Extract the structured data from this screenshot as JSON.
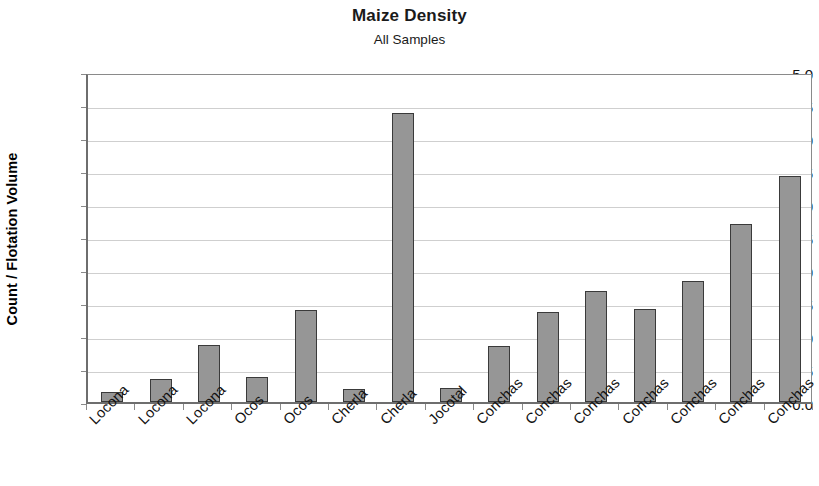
{
  "chart_data": {
    "type": "bar",
    "title": "Maize Density",
    "subtitle": "All Samples",
    "xlabel": "",
    "ylabel": "Count / Flotation Volume",
    "ylim": [
      0.0,
      5.0
    ],
    "ytick_labels": [
      "5.0",
      "4.5",
      "4.0",
      "3.5",
      "3.0",
      "2.5",
      "2.0",
      "1.5",
      "1.0",
      "0.5",
      "0.0"
    ],
    "ytick_values": [
      5.0,
      4.5,
      4.0,
      3.5,
      3.0,
      2.5,
      2.0,
      1.5,
      1.0,
      0.5,
      0.0
    ],
    "grid": true,
    "legend": false,
    "bar_color": "#969696",
    "bar_edge_color": "#3a3a3a",
    "categories": [
      "Locona",
      "Locona",
      "Locona",
      "Ocos",
      "Ocos",
      "Cherla",
      "Cherla",
      "Jocotal",
      "Conchas",
      "Conchas",
      "Conchas",
      "Conchas",
      "Conchas",
      "Conchas",
      "Conchas"
    ],
    "values": [
      0.15,
      0.35,
      0.86,
      0.38,
      1.4,
      0.2,
      4.38,
      0.21,
      0.85,
      1.36,
      1.68,
      1.41,
      1.84,
      2.7,
      3.43
    ]
  }
}
